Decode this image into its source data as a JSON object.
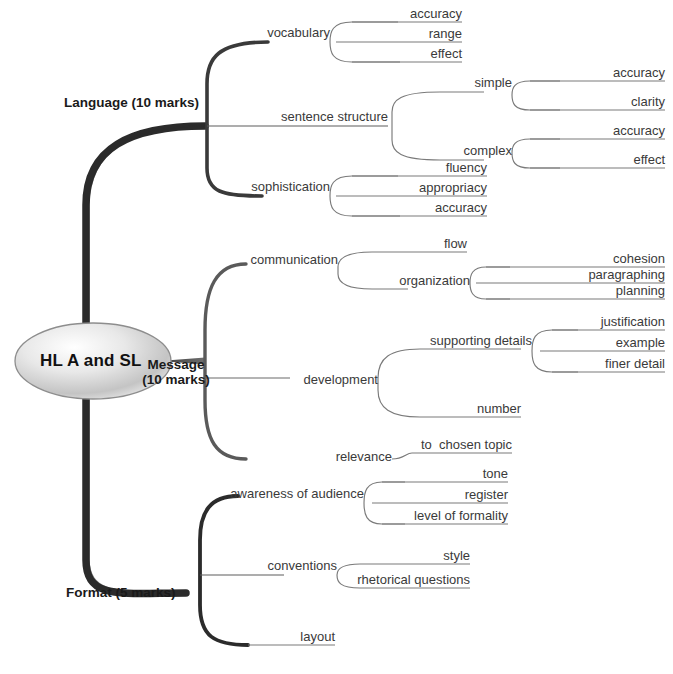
{
  "diagram": {
    "title": "HL A and SL",
    "type": "mind-map",
    "root": {
      "label": "HL A and SL"
    },
    "branches": [
      {
        "id": "language",
        "label": "Language (10 marks)",
        "marks": "10 marks",
        "children": [
          {
            "label": "vocabulary",
            "children": [
              {
                "label": "accuracy"
              },
              {
                "label": "range"
              },
              {
                "label": "effect"
              }
            ]
          },
          {
            "label": "sentence structure",
            "children": [
              {
                "label": "simple",
                "children": [
                  {
                    "label": "accuracy"
                  },
                  {
                    "label": "clarity"
                  }
                ]
              },
              {
                "label": "complex",
                "children": [
                  {
                    "label": "accuracy"
                  },
                  {
                    "label": "effect"
                  }
                ]
              }
            ]
          },
          {
            "label": "sophistication",
            "children": [
              {
                "label": "fluency"
              },
              {
                "label": "appropriacy"
              },
              {
                "label": "accuracy"
              }
            ]
          }
        ]
      },
      {
        "id": "message",
        "label": "Message\n(10 marks)",
        "marks": "10 marks",
        "children": [
          {
            "label": "communication",
            "children": [
              {
                "label": "flow"
              },
              {
                "label": "organization",
                "children": [
                  {
                    "label": "cohesion"
                  },
                  {
                    "label": "paragraphing"
                  },
                  {
                    "label": "planning"
                  }
                ]
              }
            ]
          },
          {
            "label": "development",
            "children": [
              {
                "label": "supporting details",
                "children": [
                  {
                    "label": "justification"
                  },
                  {
                    "label": "example"
                  },
                  {
                    "label": "finer detail"
                  }
                ]
              },
              {
                "label": "number"
              }
            ]
          },
          {
            "label": "relevance",
            "children": [
              {
                "label": "to  chosen topic"
              }
            ]
          }
        ]
      },
      {
        "id": "format",
        "label": "Format (5 marks)",
        "marks": "5 marks",
        "children": [
          {
            "label": "awareness of audience",
            "children": [
              {
                "label": "tone"
              },
              {
                "label": "register"
              },
              {
                "label": "level of formality"
              }
            ]
          },
          {
            "label": "conventions",
            "children": [
              {
                "label": "style"
              },
              {
                "label": "rhetorical questions"
              }
            ]
          },
          {
            "label": "layout"
          }
        ]
      }
    ],
    "colors": {
      "trunk": "#2b2b2b",
      "secondary": "#6b6b6b",
      "leaf_line": "#7a7a7a",
      "text": "#3a3a3a",
      "main_text": "#141414",
      "root_fill_light": "#fdfdfd",
      "root_fill_mid": "#b9b9b9",
      "root_stroke": "#8a8a8a",
      "background": "#ffffff"
    }
  }
}
